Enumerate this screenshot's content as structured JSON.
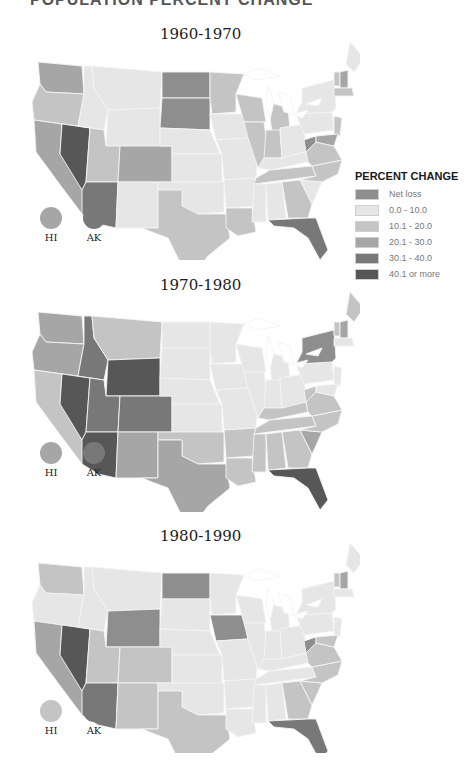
{
  "page": {
    "title_partial": "POPULATION PERCENT CHANGE"
  },
  "legend": {
    "title": "PERCENT CHANGE",
    "items": [
      {
        "key": "loss",
        "label": "Net loss",
        "color": "#8e8e8e"
      },
      {
        "key": "c0",
        "label": "0.0 - 10.0",
        "color": "#e6e6e6"
      },
      {
        "key": "c1",
        "label": "10.1 - 20.0",
        "color": "#c4c4c4"
      },
      {
        "key": "c2",
        "label": "20.1 - 30.0",
        "color": "#a6a6a6"
      },
      {
        "key": "c3",
        "label": "30.1 - 40.0",
        "color": "#787878"
      },
      {
        "key": "c4",
        "label": "40.1 or more",
        "color": "#575757"
      }
    ]
  },
  "maps": [
    {
      "title": "1960-1970",
      "territories": [
        {
          "label": "HI",
          "class": "c2"
        },
        {
          "label": "AK",
          "class": "c3"
        }
      ],
      "states": {
        "WA": "c2",
        "OR": "c1",
        "CA": "c2",
        "NV": "c4",
        "ID": "c0",
        "MT": "c0",
        "WY": "c0",
        "UT": "c1",
        "AZ": "c3",
        "CO": "c2",
        "NM": "c0",
        "ND": "loss",
        "SD": "loss",
        "NE": "c0",
        "KS": "c0",
        "OK": "c0",
        "TX": "c1",
        "MN": "c1",
        "IA": "c0",
        "MO": "c0",
        "AR": "c0",
        "LA": "c1",
        "WI": "c1",
        "IL": "c1",
        "MI": "c1",
        "IN": "c1",
        "OH": "c0",
        "KY": "c0",
        "TN": "c1",
        "MS": "c0",
        "AL": "c0",
        "GA": "c1",
        "FL": "c3",
        "SC": "c0",
        "NC": "c1",
        "VA": "c1",
        "WV": "loss",
        "PA": "c0",
        "NY": "c0",
        "ME": "c0",
        "VT": "c1",
        "NH": "c2",
        "MA": "c1",
        "NJ": "c1",
        "MD": "c2"
      }
    },
    {
      "title": "1970-1980",
      "territories": [
        {
          "label": "HI",
          "class": "c2"
        },
        {
          "label": "AK",
          "class": "c3"
        }
      ],
      "states": {
        "WA": "c2",
        "OR": "c2",
        "CA": "c1",
        "NV": "c4",
        "ID": "c3",
        "MT": "c1",
        "WY": "c4",
        "UT": "c3",
        "AZ": "c4",
        "CO": "c3",
        "NM": "c2",
        "ND": "c0",
        "SD": "c0",
        "NE": "c0",
        "KS": "c0",
        "OK": "c1",
        "TX": "c2",
        "MN": "c0",
        "IA": "c0",
        "MO": "c0",
        "AR": "c1",
        "LA": "c1",
        "WI": "c0",
        "IL": "c0",
        "MI": "c0",
        "IN": "c0",
        "OH": "c0",
        "KY": "c1",
        "TN": "c1",
        "MS": "c1",
        "AL": "c1",
        "GA": "c1",
        "FL": "c4",
        "SC": "c2",
        "NC": "c1",
        "VA": "c1",
        "WV": "c1",
        "PA": "c0",
        "NY": "loss",
        "ME": "c1",
        "VT": "c1",
        "NH": "c2",
        "MA": "c0",
        "NJ": "c0",
        "MD": "c0"
      }
    },
    {
      "title": "1980-1990",
      "territories": [
        {
          "label": "HI",
          "class": "c1"
        },
        {
          "label": "AK",
          "class": "c3"
        }
      ],
      "states": {
        "WA": "c1",
        "OR": "c0",
        "CA": "c2",
        "NV": "c4",
        "ID": "c0",
        "MT": "c0",
        "WY": "loss",
        "UT": "c1",
        "AZ": "c3",
        "CO": "c1",
        "NM": "c1",
        "ND": "loss",
        "SD": "c0",
        "NE": "c0",
        "KS": "c0",
        "OK": "c0",
        "TX": "c1",
        "MN": "c0",
        "IA": "loss",
        "MO": "c0",
        "AR": "c0",
        "LA": "c0",
        "WI": "c0",
        "IL": "c0",
        "MI": "c0",
        "IN": "c0",
        "OH": "c0",
        "KY": "c0",
        "TN": "c0",
        "MS": "c0",
        "AL": "c0",
        "GA": "c1",
        "FL": "c3",
        "SC": "c1",
        "NC": "c1",
        "VA": "c1",
        "WV": "loss",
        "PA": "c0",
        "NY": "c0",
        "ME": "c0",
        "VT": "c1",
        "NH": "c2",
        "MA": "c0",
        "NJ": "c0",
        "MD": "c1"
      }
    }
  ]
}
